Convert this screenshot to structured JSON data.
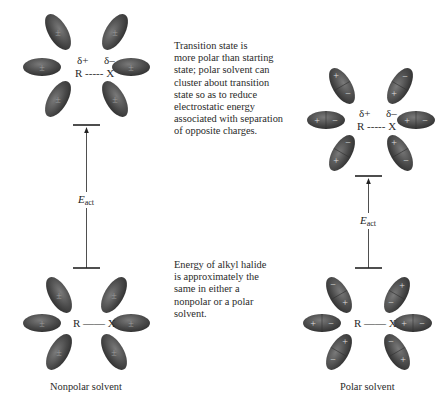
{
  "notes": {
    "transition_state": [
      "Transition state is",
      "more polar than starting",
      "state; polar solvent can",
      "cluster about transition",
      "state so as to reduce",
      "electrostatic energy",
      "associated with separation",
      "of opposite charges."
    ],
    "ground_state": [
      "Energy of alkyl halide",
      "is approximately the",
      "same in either a",
      "nonpolar or a polar",
      "solvent."
    ]
  },
  "captions": {
    "nonpolar": "Nonpolar solvent",
    "polar": "Polar solvent"
  },
  "molecules": {
    "transition_state": {
      "delta_plus": "δ+",
      "delta_minus": "δ–",
      "bond": "R ----- X"
    },
    "ground_state": {
      "bond": "R —— X"
    }
  },
  "energy": {
    "label_main": "E",
    "label_sub": "act"
  },
  "symbols": {
    "nonpolar_dipole": "±",
    "plus": "+",
    "minus": "−"
  },
  "colors": {
    "solvent_fill": "#4a4a4a",
    "solvent_highlight": "#7a7a7a",
    "line": "#222222",
    "text": "#2a2a2a"
  }
}
